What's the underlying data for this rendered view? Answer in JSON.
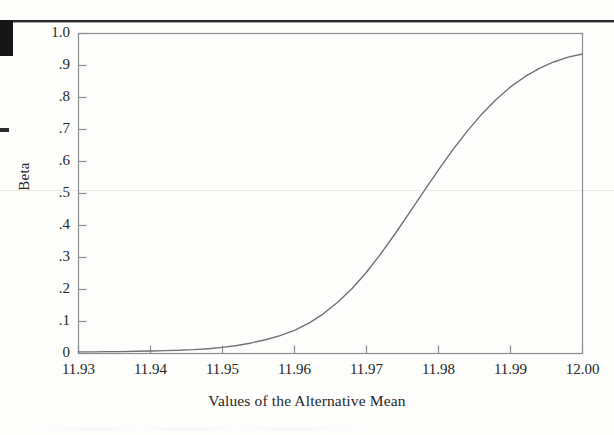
{
  "page": {
    "kind": "scanned-figure",
    "background_color": "#fdfdfc",
    "marks": {
      "top_rule_color": "#2a2a2a",
      "corner_block_color": "#161616",
      "left_dash_color": "#2b2b2b",
      "scanline_color": "#f1e7e7"
    }
  },
  "chart_data": {
    "type": "line",
    "title": "",
    "xlabel": "Values of the Alternative Mean",
    "ylabel": "Beta",
    "xlim": [
      11.93,
      12.0
    ],
    "ylim": [
      0,
      1.0
    ],
    "grid": false,
    "legend_position": "none",
    "line_color": "#6f7174",
    "line_width": 1.4,
    "frame_color": "#8a8c8e",
    "x_tick_labels": [
      "11.93",
      "11.94",
      "11.95",
      "11.96",
      "11.97",
      "11.98",
      "11.99",
      "12.00"
    ],
    "x_tick_values": [
      11.93,
      11.94,
      11.95,
      11.96,
      11.97,
      11.98,
      11.99,
      12.0
    ],
    "y_tick_labels": [
      "1.0",
      ".9",
      ".8",
      ".7",
      ".6",
      ".5",
      ".4",
      ".3",
      ".2",
      ".1",
      "0"
    ],
    "y_tick_values": [
      1.0,
      0.9,
      0.8,
      0.7,
      0.6,
      0.5,
      0.4,
      0.3,
      0.2,
      0.1,
      0.0
    ],
    "series": [
      {
        "name": "Beta",
        "x": [
          11.93,
          11.932,
          11.934,
          11.936,
          11.938,
          11.94,
          11.942,
          11.944,
          11.946,
          11.948,
          11.95,
          11.952,
          11.954,
          11.956,
          11.958,
          11.96,
          11.962,
          11.964,
          11.966,
          11.968,
          11.97,
          11.972,
          11.974,
          11.976,
          11.978,
          11.98,
          11.982,
          11.984,
          11.986,
          11.988,
          11.99,
          11.992,
          11.994,
          11.996,
          11.998,
          12.0
        ],
        "values": [
          0.005,
          0.005,
          0.006,
          0.006,
          0.007,
          0.008,
          0.009,
          0.01,
          0.012,
          0.015,
          0.019,
          0.025,
          0.033,
          0.043,
          0.056,
          0.072,
          0.095,
          0.124,
          0.16,
          0.203,
          0.254,
          0.312,
          0.375,
          0.441,
          0.508,
          0.574,
          0.637,
          0.695,
          0.748,
          0.794,
          0.833,
          0.865,
          0.891,
          0.911,
          0.926,
          0.936
        ]
      }
    ],
    "annotations": []
  }
}
